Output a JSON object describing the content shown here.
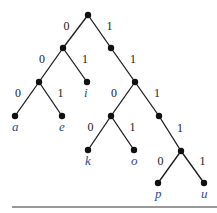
{
  "diagram": {
    "type": "binary-tree",
    "root": "root",
    "nodes": [
      {
        "id": "root",
        "x": 88,
        "y": 15
      },
      {
        "id": "n0",
        "x": 63,
        "y": 48
      },
      {
        "id": "n1",
        "x": 111,
        "y": 48
      },
      {
        "id": "n00",
        "x": 39,
        "y": 82
      },
      {
        "id": "i",
        "x": 87,
        "y": 82,
        "label": "i"
      },
      {
        "id": "n11",
        "x": 135,
        "y": 82
      },
      {
        "id": "a",
        "x": 15,
        "y": 116,
        "label": "a"
      },
      {
        "id": "e",
        "x": 62,
        "y": 116,
        "label": "e"
      },
      {
        "id": "n110",
        "x": 111,
        "y": 116
      },
      {
        "id": "n111",
        "x": 159,
        "y": 116
      },
      {
        "id": "k",
        "x": 88,
        "y": 150,
        "label": "k"
      },
      {
        "id": "o",
        "x": 134,
        "y": 150,
        "label": "o"
      },
      {
        "id": "n1111",
        "x": 181,
        "y": 151
      },
      {
        "id": "p",
        "x": 158,
        "y": 183,
        "label": "p"
      },
      {
        "id": "u",
        "x": 204,
        "y": 183,
        "label": "u"
      }
    ],
    "edges": [
      {
        "from": "root",
        "to": "n0",
        "label": "0"
      },
      {
        "from": "root",
        "to": "n1",
        "label": "1"
      },
      {
        "from": "n0",
        "to": "n00",
        "label": "0"
      },
      {
        "from": "n0",
        "to": "i",
        "label": "1"
      },
      {
        "from": "n1",
        "to": "n11",
        "label": "1"
      },
      {
        "from": "n00",
        "to": "a",
        "label": "0"
      },
      {
        "from": "n00",
        "to": "e",
        "label": "1"
      },
      {
        "from": "n11",
        "to": "n110",
        "label": "0"
      },
      {
        "from": "n11",
        "to": "n111",
        "label": "1"
      },
      {
        "from": "n110",
        "to": "k",
        "label": "0"
      },
      {
        "from": "n110",
        "to": "o",
        "label": "1"
      },
      {
        "from": "n111",
        "to": "n1111",
        "label": "1"
      },
      {
        "from": "n1111",
        "to": "p",
        "label": "0"
      },
      {
        "from": "n1111",
        "to": "u",
        "label": "1"
      }
    ],
    "leaf_labels": [
      "a",
      "e",
      "i",
      "k",
      "o",
      "p",
      "u"
    ],
    "colors": {
      "edge": "#1a1a1a",
      "leaf_label": "#2a4a9a",
      "rule": "#777777"
    }
  }
}
